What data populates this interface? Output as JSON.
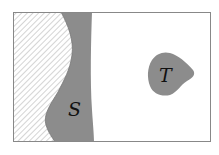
{
  "diagram": {
    "type": "region-diagram",
    "regions": [
      {
        "id": "hatched",
        "label": "",
        "style": "diagonal-hatch"
      },
      {
        "id": "S",
        "label": "S",
        "style": "gray-fill"
      },
      {
        "id": "T",
        "label": "T",
        "style": "gray-fill"
      }
    ],
    "labels": {
      "S": "S",
      "T": "T"
    },
    "colors": {
      "border": "#888888",
      "region_fill": "#8c8c8c",
      "hatch": "#b8b8b8",
      "background": "#ffffff",
      "text": "#111111"
    }
  }
}
